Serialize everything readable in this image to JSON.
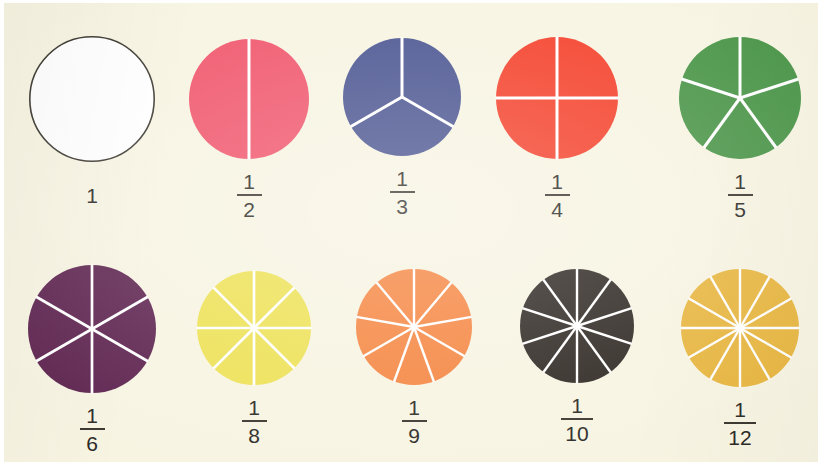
{
  "page": {
    "background_color": "#f7f4e2",
    "scan_border_color": "#ffffff",
    "divider_line_color": "#ffffff",
    "label_text_color": "#2b2a26"
  },
  "chart_data": {
    "type": "pie",
    "title": "",
    "subtitle": "",
    "xlabel": "",
    "ylabel": "",
    "legend": "none",
    "grid": false,
    "charts": [
      {
        "label": "1",
        "denominator": 1,
        "slices": 1,
        "slice_value": 1,
        "fill_color": "#ffffff",
        "outline_color": "#3a372f",
        "row": 1,
        "column": 1
      },
      {
        "label": "1/2",
        "numerator": "1",
        "denominator": 2,
        "slices": 2,
        "slice_value": 0.5,
        "fill_color": "#f0556b",
        "outline_color": "none",
        "row": 1,
        "column": 2
      },
      {
        "label": "1/3",
        "numerator": "1",
        "denominator": 3,
        "slices": 3,
        "slice_value": 0.3333,
        "fill_color": "#4a5490",
        "outline_color": "none",
        "row": 1,
        "column": 3
      },
      {
        "label": "1/4",
        "numerator": "1",
        "denominator": 4,
        "slices": 4,
        "slice_value": 0.25,
        "fill_color": "#f4402a",
        "outline_color": "none",
        "row": 1,
        "column": 4
      },
      {
        "label": "1/5",
        "numerator": "1",
        "denominator": 5,
        "slices": 5,
        "slice_value": 0.2,
        "fill_color": "#4a9548",
        "outline_color": "none",
        "row": 1,
        "column": 5
      },
      {
        "label": "1/6",
        "numerator": "1",
        "denominator": 6,
        "slices": 6,
        "slice_value": 0.1667,
        "fill_color": "#5e2450",
        "outline_color": "none",
        "row": 2,
        "column": 1
      },
      {
        "label": "1/8",
        "numerator": "1",
        "denominator": 8,
        "slices": 8,
        "slice_value": 0.125,
        "fill_color": "#ede155",
        "outline_color": "none",
        "row": 2,
        "column": 2
      },
      {
        "label": "1/9",
        "numerator": "1",
        "denominator": 9,
        "slices": 9,
        "slice_value": 0.1111,
        "fill_color": "#f58540",
        "outline_color": "none",
        "row": 2,
        "column": 3
      },
      {
        "label": "1/10",
        "numerator": "1",
        "denominator": 10,
        "slices": 10,
        "slice_value": 0.1,
        "fill_color": "#2e2722",
        "outline_color": "none",
        "row": 2,
        "column": 4
      },
      {
        "label": "1/12",
        "numerator": "1",
        "denominator": 12,
        "slices": 12,
        "slice_value": 0.0833,
        "fill_color": "#e8b63f",
        "outline_color": "none",
        "row": 2,
        "column": 5
      }
    ]
  },
  "cells": [
    {
      "id": "disc-1",
      "whole_label": "1",
      "numerator": "",
      "denominator": "",
      "is_whole": true,
      "fill": "#ffffff",
      "stroke": "#3a372f",
      "slices": 1,
      "diameter": 126,
      "x": 8,
      "y": 30,
      "bar_width": 0
    },
    {
      "id": "disc-1-2",
      "whole_label": "",
      "numerator": "1",
      "denominator": "2",
      "is_whole": false,
      "fill": "#f0556b",
      "stroke": "none",
      "slices": 2,
      "diameter": 120,
      "x": 165,
      "y": 33,
      "bar_width": 25
    },
    {
      "id": "disc-1-3",
      "whole_label": "",
      "numerator": "1",
      "denominator": "3",
      "is_whole": false,
      "fill": "#4a5490",
      "stroke": "none",
      "slices": 3,
      "diameter": 118,
      "x": 318,
      "y": 32,
      "bar_width": 25
    },
    {
      "id": "disc-1-4",
      "whole_label": "",
      "numerator": "1",
      "denominator": "4",
      "is_whole": false,
      "fill": "#f4402a",
      "stroke": "none",
      "slices": 4,
      "diameter": 122,
      "x": 473,
      "y": 31,
      "bar_width": 25
    },
    {
      "id": "disc-1-5",
      "whole_label": "",
      "numerator": "1",
      "denominator": "5",
      "is_whole": false,
      "fill": "#4a9548",
      "stroke": "none",
      "slices": 5,
      "diameter": 122,
      "x": 656,
      "y": 31,
      "bar_width": 25
    },
    {
      "id": "disc-1-6",
      "whole_label": "",
      "numerator": "1",
      "denominator": "6",
      "is_whole": false,
      "fill": "#5e2450",
      "stroke": "none",
      "slices": 6,
      "diameter": 128,
      "x": 8,
      "y": 259,
      "bar_width": 25
    },
    {
      "id": "disc-1-8",
      "whole_label": "",
      "numerator": "1",
      "denominator": "8",
      "is_whole": false,
      "fill": "#ede155",
      "stroke": "none",
      "slices": 8,
      "diameter": 114,
      "x": 170,
      "y": 265,
      "bar_width": 25
    },
    {
      "id": "disc-1-9",
      "whole_label": "",
      "numerator": "1",
      "denominator": "9",
      "is_whole": false,
      "fill": "#f58540",
      "stroke": "none",
      "slices": 9,
      "diameter": 116,
      "x": 330,
      "y": 263,
      "bar_width": 25
    },
    {
      "id": "disc-1-10",
      "whole_label": "",
      "numerator": "1",
      "denominator": "10",
      "is_whole": false,
      "fill": "#2e2722",
      "stroke": "none",
      "slices": 10,
      "diameter": 114,
      "x": 493,
      "y": 263,
      "bar_width": 32
    },
    {
      "id": "disc-1-12",
      "whole_label": "",
      "numerator": "1",
      "denominator": "12",
      "is_whole": false,
      "fill": "#e8b63f",
      "stroke": "none",
      "slices": 12,
      "diameter": 118,
      "x": 656,
      "y": 263,
      "bar_width": 32
    }
  ]
}
